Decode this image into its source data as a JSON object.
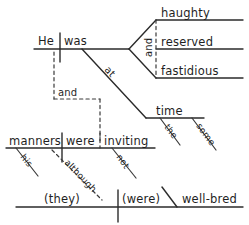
{
  "diagram": {
    "type": "reed-kellogg-sentence-diagram",
    "sentence": "He was at the same time haughty, reserved and fastidious, and although his manners were inviting, (they) (were) well-bred.",
    "ink_color": "#2b2b2b",
    "background_color": "#ffffff",
    "clauses": {
      "main": {
        "subject": "He",
        "verb": "was",
        "preposition": "at",
        "prep_object": "time",
        "prep_object_modifiers": [
          "the",
          "some"
        ],
        "compound_complement_conjunction": "and",
        "compound_complements": [
          "haughty",
          "reserved",
          "fastidious"
        ]
      },
      "connector": {
        "label": "and"
      },
      "second": {
        "subject": "manners",
        "subject_modifier": "his",
        "verb": "were",
        "complement": "inviting",
        "complement_modifier": "not",
        "subordinator": "although"
      },
      "third": {
        "subject": "(they)",
        "verb": "(were)",
        "complement": "well-bred"
      }
    },
    "labels": {
      "he": "He",
      "was": "was",
      "at": "at",
      "and_compound": "and",
      "haughty": "haughty",
      "reserved": "reserved",
      "fastidious": "fastidious",
      "time": "time",
      "the": "the",
      "some": "some",
      "and_connector": "and",
      "manners": "manners",
      "his": "his",
      "were": "were",
      "inviting": "inviting",
      "not": "not",
      "although": "although",
      "they": "(they)",
      "were_parens": "(were)",
      "well_bred": "well-bred"
    }
  }
}
